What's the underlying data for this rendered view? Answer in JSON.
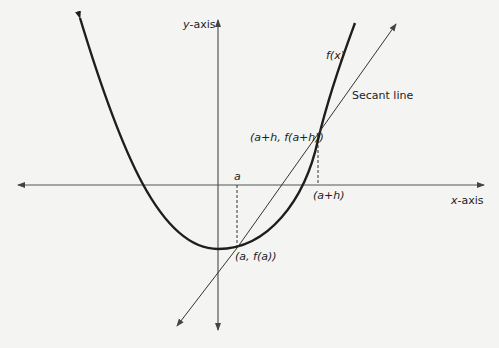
{
  "diagram": {
    "axes": {
      "x_label_var": "x",
      "x_label_suffix": "-axis",
      "y_label_var": "y",
      "y_label_suffix": "-axis"
    },
    "labels": {
      "function": "f(x)",
      "secant": "Secant line",
      "point_a_plus_h": "(a+h, f(a+h))",
      "point_a": "(a, f(a))",
      "tick_a": "a",
      "tick_a_plus_h": "(a+h)"
    },
    "colors": {
      "background": "#f4f4f2",
      "curve": "#1e1e1e",
      "axes": "#555555",
      "secant": "#333333",
      "text": "#222222"
    }
  }
}
